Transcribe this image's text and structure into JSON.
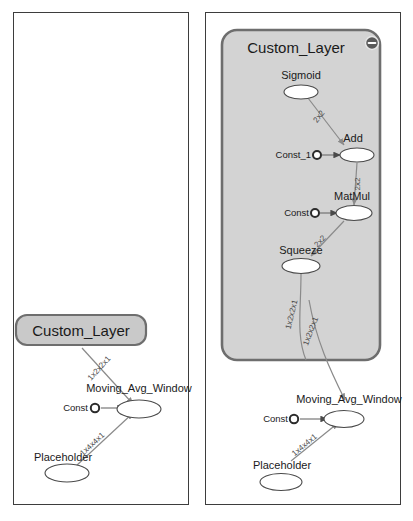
{
  "app": {
    "title": "Graph Visualization",
    "panels": [
      {
        "id": "left",
        "name": "collapsed-graph-panel"
      },
      {
        "id": "right",
        "name": "expanded-graph-panel"
      }
    ]
  },
  "left_panel": {
    "collapsed_group": {
      "label": "Custom_Layer",
      "type": "collapsed-namespace"
    },
    "nodes": [
      {
        "id": "moving_avg_window",
        "label": "Moving_Avg_Window",
        "type": "op"
      },
      {
        "id": "const",
        "label": "Const",
        "type": "constant"
      },
      {
        "id": "placeholder",
        "label": "Placeholder",
        "type": "op"
      }
    ],
    "edges": [
      {
        "from": "custom_layer",
        "to": "moving_avg_window",
        "label": "1x2x2x1"
      },
      {
        "from": "const",
        "to": "moving_avg_window",
        "label": ""
      },
      {
        "from": "placeholder",
        "to": "moving_avg_window",
        "label": "1x4x4x1"
      }
    ]
  },
  "right_panel": {
    "expanded_group": {
      "label": "Custom_Layer",
      "collapse_button": "minus-button",
      "type": "expanded-namespace"
    },
    "nodes": [
      {
        "id": "sigmoid",
        "label": "Sigmoid",
        "type": "op"
      },
      {
        "id": "const_1",
        "label": "Const_1",
        "type": "constant"
      },
      {
        "id": "add",
        "label": "Add",
        "type": "op"
      },
      {
        "id": "const",
        "label": "Const",
        "type": "constant"
      },
      {
        "id": "matmul",
        "label": "MatMul",
        "type": "op"
      },
      {
        "id": "squeeze",
        "label": "Squeeze",
        "type": "op"
      },
      {
        "id": "moving_avg_window",
        "label": "Moving_Avg_Window",
        "type": "op"
      },
      {
        "id": "const_outer",
        "label": "Const",
        "type": "constant"
      },
      {
        "id": "placeholder",
        "label": "Placeholder",
        "type": "op"
      }
    ],
    "edges": [
      {
        "from": "sigmoid",
        "to": "add",
        "label": "2x2"
      },
      {
        "from": "const_1",
        "to": "add",
        "label": ""
      },
      {
        "from": "add",
        "to": "matmul",
        "label": "2x2"
      },
      {
        "from": "const",
        "to": "matmul",
        "label": ""
      },
      {
        "from": "matmul",
        "to": "squeeze",
        "label": "2x2"
      },
      {
        "from": "squeeze",
        "to": "moving_avg_window",
        "label": "1x2x2x1"
      },
      {
        "from": "group",
        "to": "moving_avg_window",
        "label": "1x2x2x1"
      },
      {
        "from": "const_outer",
        "to": "moving_avg_window",
        "label": ""
      },
      {
        "from": "placeholder",
        "to": "moving_avg_window",
        "label": "1x4x4x1"
      }
    ]
  },
  "colors": {
    "group_fill": "#d3d3d3",
    "group_stroke": "#6e6e6e",
    "collapsed_fill": "#c9c9c9",
    "node_fill": "#ffffff",
    "edge_stroke": "#8a8a8a",
    "panel_border": "#3d3d3d",
    "text": "#1a1a1a"
  }
}
